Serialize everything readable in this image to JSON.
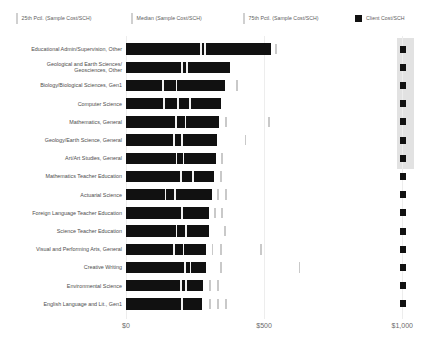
{
  "legend": {
    "items": [
      {
        "id": "p25",
        "label": "25th Pctl. (Sample Cost/SCH)",
        "marker": "tick-icon",
        "color": "#d0d0d0"
      },
      {
        "id": "median",
        "label": "Median (Sample Cost/SCH)",
        "marker": "tick-icon",
        "color": "#d0d0d0"
      },
      {
        "id": "p75",
        "label": "75th Pctl. (Sample Cost/SCH)",
        "marker": "tick-icon",
        "color": "#d0d0d0"
      },
      {
        "id": "client",
        "label": "Client Cost/SCH",
        "marker": "square-icon",
        "color": "#111111"
      }
    ]
  },
  "axis": {
    "x": {
      "ticks": [
        0,
        500,
        1000
      ],
      "tick_labels": [
        "$0",
        "$500",
        "$1,000"
      ],
      "min": 0,
      "max": 1115
    }
  },
  "chart_data": {
    "type": "bar",
    "title": "",
    "xlabel": "",
    "ylabel": "",
    "xlim": [
      0,
      1115
    ],
    "grid": true,
    "legend_position": "top",
    "orientation": "horizontal",
    "tick_labels": [
      "$0",
      "$500",
      "$1,000"
    ],
    "ticks": [
      0,
      500,
      1000
    ],
    "categories": [
      "Educational Admin/Supervision, Other",
      "Geological and Earth Sciences/\nGeosciences, Other",
      "Biology/Biological Sciences, Gen1",
      "Computer Science",
      "Mathematics, General",
      "Geology/Earth Science, General",
      "Art/Art Studies, General",
      "Mathematics Teacher Education",
      "Actuarial Science",
      "Foreign Language Teacher Education",
      "Science Teacher Education",
      "Visual and Performing Arts, General",
      "Creative Writing",
      "Environmental Science",
      "English Language and Lit., Gen1"
    ],
    "series": [
      {
        "name": "Client Cost/SCH",
        "values": [
          1003,
          1003,
          1003,
          1003,
          1003,
          1003,
          1003,
          1003,
          1003,
          1003,
          1003,
          1003,
          1003,
          1003,
          1003
        ]
      },
      {
        "name": "Bar Extent (Sample Cost/SCH)",
        "values": [
          525,
          375,
          360,
          345,
          335,
          330,
          325,
          320,
          310,
          300,
          300,
          290,
          290,
          280,
          275
        ]
      },
      {
        "name": "25th Pctl. (Sample Cost/SCH)",
        "values": [
          268,
          200,
          130,
          135,
          178,
          170,
          180,
          195,
          140,
          165,
          180,
          170,
          165,
          195,
          170
        ]
      },
      {
        "name": "Median (Sample Cost/SCH)",
        "values": [
          282,
          218,
          180,
          185,
          212,
          200,
          205,
          240,
          175,
          200,
          215,
          205,
          210,
          215,
          200
        ]
      },
      {
        "name": "75th Pctl. (Sample Cost/SCH)",
        "values": [
          540,
          250,
          400,
          228,
          360,
          430,
          345,
          340,
          330,
          345,
          355,
          485,
          625,
          330,
          360
        ]
      }
    ]
  },
  "rows": [
    {
      "label": "Educational Admin/Supervision, Other",
      "bar": 525,
      "ticks_in": [
        268,
        282
      ],
      "ticks_out": [
        540
      ]
    },
    {
      "label": "Geological and Earth Sciences/\nGeosciences, Other",
      "bar": 375,
      "ticks_in": [
        200,
        218
      ],
      "ticks_out": []
    },
    {
      "label": "Biology/Biological Sciences, Gen1",
      "bar": 360,
      "ticks_in": [
        130,
        180
      ],
      "ticks_out": [
        400
      ]
    },
    {
      "label": "Computer Science",
      "bar": 345,
      "ticks_in": [
        135,
        185,
        228
      ],
      "ticks_out": []
    },
    {
      "label": "Mathematics, General",
      "bar": 335,
      "ticks_in": [
        178,
        212
      ],
      "ticks_out": [
        360,
        515
      ]
    },
    {
      "label": "Geology/Earth Science, General",
      "bar": 330,
      "ticks_in": [
        170,
        200
      ],
      "ticks_out": [
        430
      ]
    },
    {
      "label": "Art/Art Studies, General",
      "bar": 325,
      "ticks_in": [
        180,
        205
      ],
      "ticks_out": [
        345
      ]
    },
    {
      "label": "Mathematics Teacher Education",
      "bar": 320,
      "ticks_in": [
        195,
        240
      ],
      "ticks_out": [
        340
      ]
    },
    {
      "label": "Actuarial Science",
      "bar": 310,
      "ticks_in": [
        140,
        175
      ],
      "ticks_out": [
        330,
        360
      ]
    },
    {
      "label": "Foreign Language Teacher Education",
      "bar": 300,
      "ticks_in": [
        200
      ],
      "ticks_out": [
        320,
        345
      ]
    },
    {
      "label": "Science Teacher Education",
      "bar": 300,
      "ticks_in": [
        180,
        215
      ],
      "ticks_out": [
        355
      ]
    },
    {
      "label": "Visual and Performing Arts, General",
      "bar": 290,
      "ticks_in": [
        170,
        205
      ],
      "ticks_out": [
        310,
        340,
        485
      ]
    },
    {
      "label": "Creative Writing",
      "bar": 290,
      "ticks_in": [
        210,
        230
      ],
      "ticks_out": [
        340,
        625
      ]
    },
    {
      "label": "Environmental Science",
      "bar": 280,
      "ticks_in": [
        195,
        215
      ],
      "ticks_out": [
        300,
        330
      ]
    },
    {
      "label": "English Language and Lit., Gen1",
      "bar": 275,
      "ticks_in": [
        200
      ],
      "ticks_out": [
        300,
        330,
        360
      ]
    }
  ]
}
